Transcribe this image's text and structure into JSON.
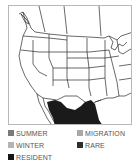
{
  "map": {
    "region": "North America (USA & northern Mexico)",
    "range_shown": "resident",
    "range_color": "#1a1a1a",
    "border_color": "#2a2a2a"
  },
  "legend": {
    "items": [
      {
        "label": "SUMMER",
        "color": "#7a7a7a"
      },
      {
        "label": "MIGRATION",
        "color": "#a8a8a8"
      },
      {
        "label": "WINTER",
        "color": "#b4b4b4"
      },
      {
        "label": "RARE",
        "color": "#2e2e2e"
      },
      {
        "label": "RESIDENT",
        "color": "#161616"
      }
    ]
  }
}
